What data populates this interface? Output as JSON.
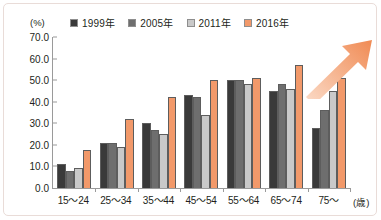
{
  "chart_data": {
    "type": "bar",
    "title": "",
    "subtitle": "",
    "xlabel": "(歳)",
    "ylabel": "(%)",
    "ylim": [
      0.0,
      70.0
    ],
    "ytick_step": 10.0,
    "yticks": [
      "70.0",
      "60.0",
      "50.0",
      "40.0",
      "30.0",
      "20.0",
      "10.0",
      "0.0"
    ],
    "grid": false,
    "legend_position": "top",
    "categories": [
      "15～24",
      "25～34",
      "35～44",
      "45～54",
      "55～64",
      "65～74",
      "75～"
    ],
    "series": [
      {
        "name": "1999年",
        "color": "#3a3a3a",
        "values": [
          11.0,
          21.0,
          30.0,
          43.0,
          50.0,
          45.0,
          28.0
        ]
      },
      {
        "name": "2005年",
        "color": "#6e6e6e",
        "values": [
          8.0,
          21.0,
          27.0,
          42.0,
          50.0,
          48.0,
          36.0
        ]
      },
      {
        "name": "2011年",
        "color": "#c9c9c9",
        "values": [
          9.5,
          19.0,
          25.0,
          34.0,
          48.0,
          46.0,
          45.0
        ]
      },
      {
        "name": "2016年",
        "color": "#f2996a",
        "values": [
          17.5,
          32.0,
          42.0,
          50.0,
          51.0,
          57.0,
          51.0
        ]
      }
    ],
    "annotations": [
      {
        "name": "trend-arrow",
        "kind": "arrow",
        "direction": "up-right",
        "color": "#f2a07a"
      }
    ]
  },
  "axes": {
    "y_unit_label": "(%)",
    "x_unit_label": "(歳)"
  }
}
